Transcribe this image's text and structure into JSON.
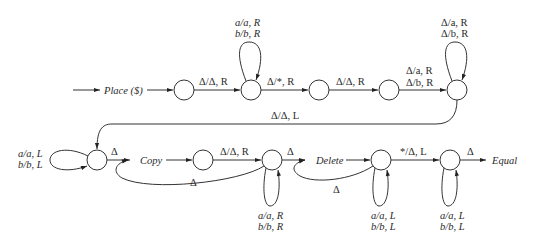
{
  "diagram": {
    "type": "turing-machine-state-diagram",
    "colors": {
      "stroke": "#333333",
      "text": "#2a2a2a",
      "background": "#ffffff"
    },
    "macros": {
      "place": "Place ($)",
      "copy": "Copy",
      "delete": "Delete",
      "equal": "Equal"
    },
    "states": [
      {
        "id": "s1",
        "x": 184,
        "y": 90
      },
      {
        "id": "s2",
        "x": 251,
        "y": 90
      },
      {
        "id": "s3",
        "x": 319,
        "y": 90
      },
      {
        "id": "s4",
        "x": 389,
        "y": 90
      },
      {
        "id": "s5",
        "x": 457,
        "y": 90
      },
      {
        "id": "s6",
        "x": 97,
        "y": 160
      },
      {
        "id": "s7",
        "x": 203,
        "y": 160
      },
      {
        "id": "s8",
        "x": 272,
        "y": 160
      },
      {
        "id": "s9",
        "x": 381,
        "y": 160
      },
      {
        "id": "s10",
        "x": 450,
        "y": 160
      }
    ],
    "labels": {
      "s1_s2": "Δ/Δ, R",
      "s2_loop": [
        "a/a, R",
        "b/b, R"
      ],
      "s2_s3": "Δ/*, R",
      "s3_s4": "Δ/Δ, R",
      "s4_s5": [
        "Δ/a, R",
        "Δ/b, R"
      ],
      "s5_loop": [
        "Δ/a, R",
        "Δ/b, R"
      ],
      "s5_s6": "Δ/Δ, L",
      "s6_loop": [
        "a/a, L",
        "b/b, L"
      ],
      "s6_copy": "Δ",
      "s7_s8": "Δ/Δ, R",
      "s8_copy_back": "Δ",
      "s8_loop": [
        "a/a, R",
        "b/b, R"
      ],
      "s8_delete": "Δ",
      "s9_delete_back": "Δ",
      "s9_loop": [
        "a/a, L",
        "b/b, L"
      ],
      "s9_s10": "*/Δ, L",
      "s10_loop": [
        "a/a, L",
        "b/b, L"
      ],
      "s10_equal": "Δ"
    }
  }
}
